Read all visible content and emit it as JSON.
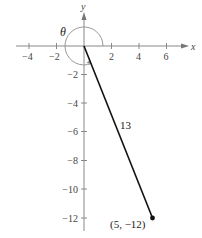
{
  "diagram": {
    "type": "angle-in-standard-position",
    "axes": {
      "x_label": "x",
      "y_label": "y",
      "x_ticks": [
        {
          "value": -4,
          "label": "−4"
        },
        {
          "value": -2,
          "label": "−2"
        },
        {
          "value": 2,
          "label": "2"
        },
        {
          "value": 4,
          "label": "4"
        },
        {
          "value": 6,
          "label": "6"
        }
      ],
      "y_ticks": [
        {
          "value": -2,
          "label": "−2"
        },
        {
          "value": -4,
          "label": "−4"
        },
        {
          "value": -6,
          "label": "−6"
        },
        {
          "value": -8,
          "label": "−8"
        },
        {
          "value": -10,
          "label": "−10"
        },
        {
          "value": -12,
          "label": "−12"
        }
      ]
    },
    "angle_label": "θ",
    "segment_length_label": "13",
    "point": {
      "x": 5,
      "y": -12,
      "label": "(5, −12)"
    },
    "colors": {
      "axis": "#888888",
      "segment": "#111111",
      "arc": "#999999"
    }
  }
}
